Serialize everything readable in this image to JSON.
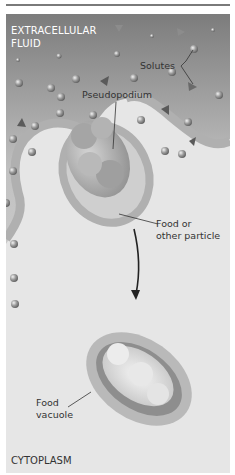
{
  "figure": {
    "topic": "Phagocytosis",
    "regions": {
      "outside": "EXTRACELLULAR FLUID",
      "inside": "CYTOPLASM"
    },
    "labels": {
      "solutes": "Solutes",
      "pseudopodium": "Pseudopodium",
      "food_particle_line1": "Food or",
      "food_particle_line2": "other particle",
      "vacuole_line1": "Food",
      "vacuole_line2": "vacuole"
    },
    "colors": {
      "extracellular_top": "#8a8a8a",
      "extracellular_bottom": "#d8d8d8",
      "cytoplasm": "#e6e6e6",
      "membrane": "#b5b5b5",
      "particle": "#a8a8a8",
      "solute": "#909090",
      "rule": "#7a7a7a"
    }
  }
}
